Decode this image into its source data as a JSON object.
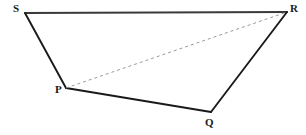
{
  "figure": {
    "name": "quadrilateral-spqr",
    "background_color": "#ffffff",
    "width": 306,
    "height": 135,
    "vertices": [
      {
        "id": "S",
        "label": "S",
        "x": 25,
        "y": 13,
        "label_x": 13,
        "label_y": 3
      },
      {
        "id": "R",
        "label": "R",
        "x": 287,
        "y": 12,
        "label_x": 290,
        "label_y": 3
      },
      {
        "id": "Q",
        "label": "Q",
        "x": 211,
        "y": 112,
        "label_x": 205,
        "label_y": 117
      },
      {
        "id": "P",
        "label": "P",
        "x": 66,
        "y": 88,
        "label_x": 55,
        "label_y": 84
      }
    ],
    "edges": [
      {
        "id": "edge-SR",
        "from": "S",
        "to": "R",
        "style": "solid",
        "color": "#3a3a3a",
        "width": 2.1
      },
      {
        "id": "edge-SP",
        "from": "S",
        "to": "P",
        "style": "solid",
        "color": "#1a1a1a",
        "width": 1.9
      },
      {
        "id": "edge-PQ",
        "from": "P",
        "to": "Q",
        "style": "solid",
        "color": "#1a1a1a",
        "width": 1.9
      },
      {
        "id": "edge-QR",
        "from": "Q",
        "to": "R",
        "style": "solid",
        "color": "#1a1a1a",
        "width": 1.9
      }
    ],
    "diagonals": [
      {
        "id": "diagonal-PR",
        "from": "P",
        "to": "R",
        "style": "dashed",
        "color": "#999999",
        "width": 1,
        "dash_pattern": "3,3"
      }
    ],
    "label_color": "#1a1a1a",
    "label_font_size": 11
  }
}
